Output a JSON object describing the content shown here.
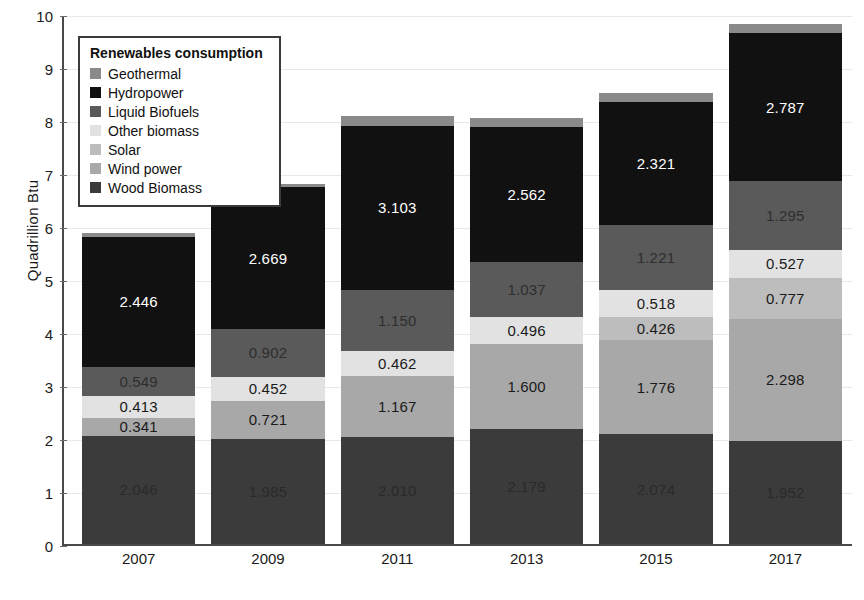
{
  "chart_data": {
    "type": "bar",
    "subtype": "stacked-bar",
    "title": "",
    "xlabel": "",
    "ylabel": "Quadrillion Btu",
    "categories": [
      "2007",
      "2009",
      "2011",
      "2013",
      "2015",
      "2017"
    ],
    "ylim": [
      0,
      10
    ],
    "ytick_labels": [
      "0",
      "1",
      "2",
      "3",
      "4",
      "5",
      "6",
      "7",
      "8",
      "9",
      "10"
    ],
    "ytick_values": [
      0,
      1,
      2,
      3,
      4,
      5,
      6,
      7,
      8,
      9,
      10
    ],
    "grid": true,
    "grid_axis": "y",
    "legend_position": "upper-left-inside",
    "legend_title": "Renewables consumption",
    "stack_order_bottom_to_top": [
      "Wood Biomass",
      "Wind power",
      "Solar",
      "Other biomass",
      "Liquid Biofuels",
      "Hydropower",
      "Geothermal"
    ],
    "series": [
      {
        "name": "Wood Biomass",
        "color": "#3b3b3b",
        "label_color": "#2a2a2a",
        "values": [
          2.046,
          1.985,
          2.01,
          2.179,
          2.074,
          1.952
        ],
        "value_labels": [
          "2.046",
          "1.985",
          "2.010",
          "2.179",
          "2.074",
          "1.952"
        ]
      },
      {
        "name": "Wind power",
        "color": "#a8a8a8",
        "label_color": "#1a1a1a",
        "values": [
          0.341,
          0.721,
          1.167,
          1.6,
          1.776,
          2.298
        ],
        "value_labels": [
          "0.341",
          "0.721",
          "1.167",
          "1.600",
          "1.776",
          "2.298"
        ]
      },
      {
        "name": "Solar",
        "color": "#bdbdbd",
        "label_color": "#1a1a1a",
        "values": [
          0.0,
          0.0,
          0.0,
          0.0,
          0.426,
          0.777
        ],
        "value_labels": [
          "",
          "",
          "",
          "",
          "0.426",
          "0.777"
        ]
      },
      {
        "name": "Other biomass",
        "color": "#e2e2e2",
        "label_color": "#1a1a1a",
        "values": [
          0.413,
          0.452,
          0.462,
          0.496,
          0.518,
          0.527
        ],
        "value_labels": [
          "0.413",
          "0.452",
          "0.462",
          "0.496",
          "0.518",
          "0.527"
        ]
      },
      {
        "name": "Liquid Biofuels",
        "color": "#5a5a5a",
        "label_color": "#2e2e2e",
        "values": [
          0.549,
          0.902,
          1.15,
          1.037,
          1.221,
          1.295
        ],
        "value_labels": [
          "0.549",
          "0.902",
          "1.150",
          "1.037",
          "1.221",
          "1.295"
        ]
      },
      {
        "name": "Hydropower",
        "color": "#111111",
        "label_color": "#ffffff",
        "values": [
          2.446,
          2.669,
          3.103,
          2.562,
          2.321,
          2.787
        ],
        "value_labels": [
          "2.446",
          "2.669",
          "3.103",
          "2.562",
          "2.321",
          "2.787"
        ]
      },
      {
        "name": "Geothermal",
        "color": "#8a8a8a",
        "label_color": "#1a1a1a",
        "values": [
          0.075,
          0.07,
          0.175,
          0.165,
          0.165,
          0.175
        ],
        "value_labels": [
          "",
          "",
          "",
          "",
          "",
          ""
        ]
      }
    ],
    "totals": [
      5.87,
      6.799,
      8.067,
      8.039,
      8.501,
      9.811
    ]
  },
  "legend": {
    "title": "Renewables consumption",
    "items": [
      {
        "label": "Geothermal",
        "color": "#8a8a8a"
      },
      {
        "label": "Hydropower",
        "color": "#111111"
      },
      {
        "label": "Liquid Biofuels",
        "color": "#5a5a5a"
      },
      {
        "label": "Other biomass",
        "color": "#e2e2e2"
      },
      {
        "label": "Solar",
        "color": "#bdbdbd"
      },
      {
        "label": "Wind power",
        "color": "#a8a8a8"
      },
      {
        "label": "Wood Biomass",
        "color": "#3b3b3b"
      }
    ]
  },
  "axes": {
    "y_title": "Quadrillion Btu"
  }
}
